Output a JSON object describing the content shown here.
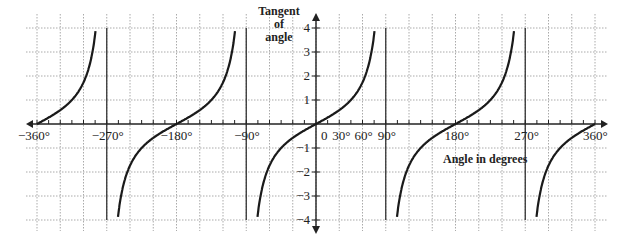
{
  "chart_data": {
    "type": "line",
    "title": "",
    "xlabel": "Angle in degrees",
    "ylabel": "Tangent of angle",
    "ylabel_lines": [
      "Tangent",
      "of",
      "angle"
    ],
    "xlim": [
      -360,
      360
    ],
    "ylim": [
      -4,
      4
    ],
    "grid": true,
    "x_tick_labels": [
      {
        "value": -360,
        "label": "−360°"
      },
      {
        "value": -270,
        "label": "−270°"
      },
      {
        "value": -180,
        "label": "−180°"
      },
      {
        "value": -90,
        "label": "−90°"
      },
      {
        "value": 0,
        "label": "0"
      },
      {
        "value": 30,
        "label": "30°"
      },
      {
        "value": 60,
        "label": "60°"
      },
      {
        "value": 90,
        "label": "90°"
      },
      {
        "value": 180,
        "label": "180°"
      },
      {
        "value": 270,
        "label": "270°"
      },
      {
        "value": 360,
        "label": "360°"
      }
    ],
    "y_tick_labels": [
      {
        "value": 4,
        "label": "4"
      },
      {
        "value": 3,
        "label": "3"
      },
      {
        "value": 2,
        "label": "2"
      },
      {
        "value": 1,
        "label": "1"
      },
      {
        "value": -1,
        "label": "−1"
      },
      {
        "value": -2,
        "label": "−2"
      },
      {
        "value": -3,
        "label": "−3"
      },
      {
        "value": -4,
        "label": "−4"
      }
    ],
    "asymptotes": [
      -270,
      -90,
      90,
      270
    ],
    "series": [
      {
        "name": "y = tan x",
        "function": "tan",
        "x_step": 2,
        "sample_points": [
          {
            "x": -360,
            "y": 0
          },
          {
            "x": -315,
            "y": 1
          },
          {
            "x": -300,
            "y": 1.73
          },
          {
            "x": -225,
            "y": -1
          },
          {
            "x": -180,
            "y": 0
          },
          {
            "x": -135,
            "y": 1
          },
          {
            "x": -45,
            "y": -1
          },
          {
            "x": 0,
            "y": 0
          },
          {
            "x": 30,
            "y": 0.58
          },
          {
            "x": 45,
            "y": 1
          },
          {
            "x": 60,
            "y": 1.73
          },
          {
            "x": 135,
            "y": -1
          },
          {
            "x": 180,
            "y": 0
          },
          {
            "x": 225,
            "y": 1
          },
          {
            "x": 315,
            "y": -1
          },
          {
            "x": 360,
            "y": 0
          }
        ]
      }
    ]
  }
}
